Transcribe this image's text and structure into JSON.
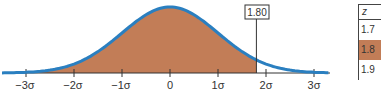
{
  "chart_data": {
    "type": "area",
    "title": "",
    "xlabel": "",
    "ylabel": "",
    "distribution": "standard normal",
    "tick_labels": [
      "−3σ",
      "−2σ",
      "−1σ",
      "0",
      "1σ",
      "2σ",
      "3σ"
    ],
    "tick_values": [
      -3,
      -2,
      -1,
      0,
      1,
      2,
      3
    ],
    "shaded_region": {
      "from": "-inf",
      "to": 1.8
    },
    "marker": {
      "value": 1.8,
      "label": "1.80"
    },
    "xlim": [
      -3.5,
      3.4
    ],
    "grid": false,
    "legend": null
  },
  "marker_label": "1.80",
  "ticks": {
    "t0": "−3σ",
    "t1": "−2σ",
    "t2": "−1σ",
    "t3": "0",
    "t4": "1σ",
    "t5": "2σ",
    "t6": "3σ"
  },
  "z_table": {
    "header": "z",
    "rows": [
      "1.7",
      "1.8",
      "1.9"
    ],
    "highlighted_row": "1.8"
  },
  "colors": {
    "curve": "#2a7fc0",
    "fill": "#c27d57",
    "axis": "#333333"
  }
}
